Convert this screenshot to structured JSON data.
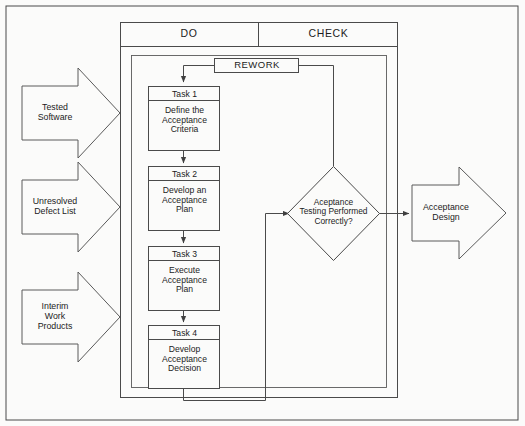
{
  "diagram": {
    "type": "flowchart",
    "outer_border": true,
    "colors": {
      "background": "#fbfbfa",
      "stroke": "#4a4a4a",
      "text": "#1c1c1c"
    },
    "phase_headers": [
      {
        "label": "DO"
      },
      {
        "label": "CHECK"
      }
    ],
    "rework": {
      "label": "REWORK"
    },
    "tasks": [
      {
        "title": "Task 1",
        "body": "Define the\nAcceptance\nCriteria"
      },
      {
        "title": "Task 2",
        "body": "Develop an\nAcceptance\nPlan"
      },
      {
        "title": "Task 3",
        "body": "Execute\nAcceptance\nPlan"
      },
      {
        "title": "Task 4",
        "body": "Develop\nAcceptance\nDecision"
      }
    ],
    "decision": {
      "label": "Aceptance\nTesting Performed\nCorrectly?"
    },
    "inputs": [
      {
        "label": "Tested\nSoftware"
      },
      {
        "label": "Unresolved\nDefect List"
      },
      {
        "label": "Interim\nWork\nProducts"
      }
    ],
    "outputs": [
      {
        "label": "Acceptance\nDesign"
      }
    ]
  }
}
